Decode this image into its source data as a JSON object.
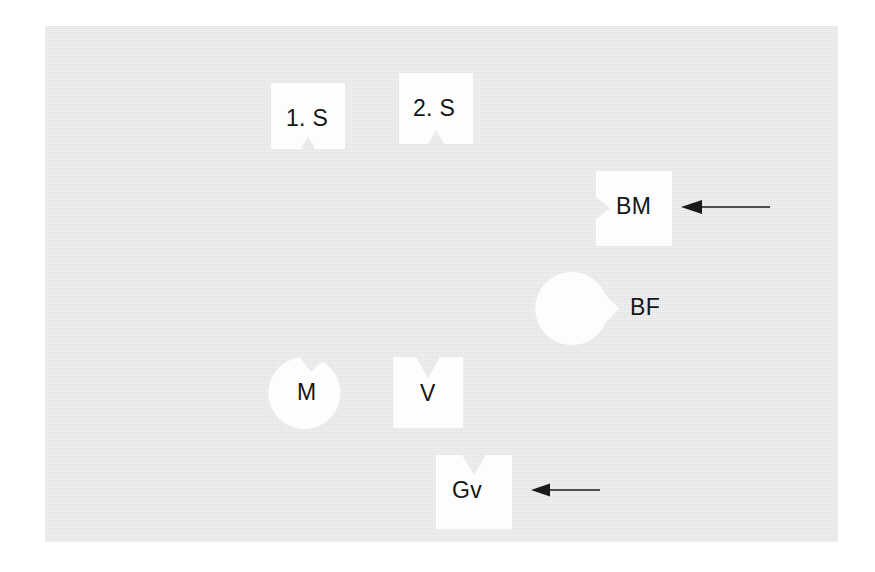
{
  "figure": {
    "background_color": "#ffffff",
    "panel_color": "#e2e2e2",
    "shape_fill": "#fdfdfd",
    "label_color": "#151515",
    "arrow_color": "#1a1a1a",
    "panel": {
      "x": 45,
      "y": 26,
      "width": 793,
      "height": 516
    }
  },
  "shapes": [
    {
      "id": "s1",
      "label": "1. S",
      "form": "square",
      "notch": "bottom-center",
      "x": 271,
      "y": 83,
      "width": 74,
      "height": 66
    },
    {
      "id": "s2",
      "label": "2. S",
      "form": "square",
      "notch": "bottom-center",
      "x": 399,
      "y": 73,
      "width": 74,
      "height": 71
    },
    {
      "id": "bm",
      "label": "BM",
      "form": "square",
      "notch": "left-center",
      "x": 596,
      "y": 171,
      "width": 76,
      "height": 75
    },
    {
      "id": "bf",
      "label": "BF",
      "form": "circle",
      "notch": "left-center",
      "x": 602,
      "y": 272,
      "width": 73,
      "height": 73
    },
    {
      "id": "m",
      "label": "M",
      "form": "circle",
      "notch": "top-center",
      "x": 271,
      "y": 356,
      "width": 72,
      "height": 72
    },
    {
      "id": "v",
      "label": "V",
      "form": "square",
      "notch": "top-center",
      "x": 393,
      "y": 357,
      "width": 70,
      "height": 71
    },
    {
      "id": "gv",
      "label": "Gv",
      "form": "square",
      "notch": "top-center",
      "x": 436,
      "y": 455,
      "width": 76,
      "height": 74
    }
  ],
  "arrows": [
    {
      "id": "arrow-bm",
      "points_to": "BM",
      "direction": "left",
      "x": 680,
      "y": 196,
      "length": 88
    },
    {
      "id": "arrow-gv",
      "points_to": "Gv",
      "direction": "left",
      "x": 530,
      "y": 479,
      "length": 68
    }
  ]
}
